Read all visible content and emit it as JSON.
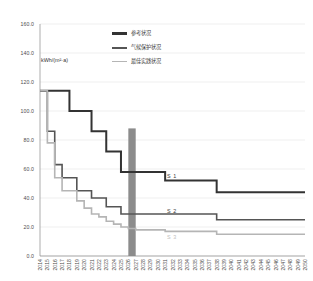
{
  "chart_data": {
    "type": "line",
    "title": "",
    "xlabel": "",
    "ylabel": "kWh/(m²·a)",
    "ylim": [
      0,
      160
    ],
    "yticks": [
      "0.0",
      "20.0",
      "40.0",
      "60.0",
      "80.0",
      "100.0",
      "120.0",
      "140.0",
      "160.0"
    ],
    "ytick_values": [
      0,
      20,
      40,
      60,
      80,
      100,
      120,
      140,
      160
    ],
    "grid": true,
    "legend_position": "top-center",
    "x": [
      2014,
      2015,
      2016,
      2017,
      2018,
      2019,
      2020,
      2021,
      2022,
      2023,
      2024,
      2025,
      2026,
      2027,
      2028,
      2029,
      2030,
      2031,
      2032,
      2033,
      2034,
      2035,
      2036,
      2037,
      2038,
      2039,
      2040,
      2041,
      2042,
      2043,
      2044,
      2045,
      2046,
      2047,
      2048,
      2049,
      2050
    ],
    "series": [
      {
        "name": "参考状况",
        "tag": "S 1",
        "color": "#333333",
        "width": 2.0,
        "values": [
          114,
          114,
          114,
          114,
          100,
          100,
          100,
          86,
          86,
          72,
          72,
          58,
          58,
          58,
          58,
          58,
          58,
          52,
          52,
          52,
          52,
          52,
          52,
          52,
          44,
          44,
          44,
          44,
          44,
          44,
          44,
          44,
          44,
          44,
          44,
          44,
          44
        ]
      },
      {
        "name": "气候保护状况",
        "tag": "S 2",
        "color": "#555555",
        "width": 1.6,
        "values": [
          114,
          86,
          63,
          54,
          54,
          45,
          45,
          40,
          40,
          34,
          34,
          29,
          29,
          29,
          29,
          29,
          29,
          29,
          29,
          29,
          29,
          29,
          29,
          29,
          25,
          25,
          25,
          25,
          25,
          25,
          25,
          25,
          25,
          25,
          25,
          25,
          25
        ]
      },
      {
        "name": "最佳实践状况",
        "tag": "S 3",
        "color": "#b5b5b5",
        "width": 1.6,
        "values": [
          114,
          78,
          54,
          45,
          45,
          38,
          33,
          29,
          27,
          24,
          22,
          20,
          19,
          18,
          18,
          18,
          18,
          17,
          17,
          17,
          17,
          17,
          17,
          17,
          15,
          15,
          15,
          15,
          15,
          15,
          15,
          15,
          15,
          15,
          15,
          15,
          15
        ]
      }
    ],
    "marker_band": {
      "name": "highlight-band",
      "x_start": 2026,
      "x_end": 2027,
      "color": "#8c8c8c",
      "y_top": 88,
      "y_bottom": 0
    }
  }
}
